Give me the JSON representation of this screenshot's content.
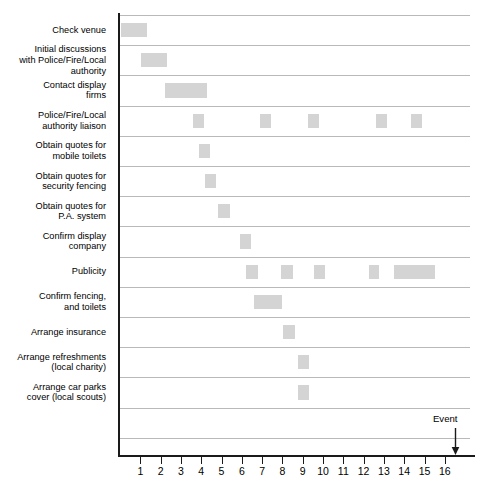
{
  "chart_data": {
    "type": "bar",
    "subtype": "gantt",
    "title": "",
    "xlabel": "",
    "ylabel": "",
    "xlim": [
      0,
      17.5
    ],
    "ylim": [
      0,
      14
    ],
    "grid": true,
    "legend": null,
    "bar_color": "#d4d4d4",
    "axis_color": "#1a1a1a",
    "gridline_color": "#b9b9b9",
    "x_ticks": [
      1,
      2,
      3,
      4,
      5,
      6,
      7,
      8,
      9,
      10,
      11,
      12,
      13,
      14,
      15,
      16
    ],
    "x_tick_labels": [
      "1",
      "2",
      "3",
      "4",
      "5",
      "6",
      "7",
      "8",
      "9",
      "10",
      "11",
      "12",
      "13",
      "14",
      "15",
      "16"
    ],
    "categories": [
      "Check venue",
      "Initial discussions with Police/Fire/Local authority",
      "Contact display firms",
      "Police/Fire/Local authority liaison",
      "Obtain quotes for mobile toilets",
      "Obtain quotes for security fencing",
      "Obtain quotes for P.A. system",
      "Confirm display company",
      "Publicity",
      "Confirm fencing, and toilets",
      "Arrange insurance",
      "Arrange refreshments (local charity)",
      "Arrange car parks cover (local scouts)"
    ],
    "tasks": [
      {
        "name": "Check venue",
        "label_lines": [
          "Check venue"
        ],
        "bars": [
          {
            "start": 0.05,
            "end": 1.35
          }
        ]
      },
      {
        "name": "Initial discussions with Police/Fire/Local authority",
        "label_lines": [
          "Initial discussions",
          "with Police/Fire/Local",
          "authority"
        ],
        "bars": [
          {
            "start": 1.05,
            "end": 2.3
          }
        ]
      },
      {
        "name": "Contact display firms",
        "label_lines": [
          "Contact display",
          "firms"
        ],
        "bars": [
          {
            "start": 2.2,
            "end": 4.3
          }
        ]
      },
      {
        "name": "Police/Fire/Local authority liaison",
        "label_lines": [
          "Police/Fire/Local",
          "authority liaison"
        ],
        "bars": [
          {
            "start": 3.6,
            "end": 4.15
          },
          {
            "start": 6.9,
            "end": 7.45
          },
          {
            "start": 9.25,
            "end": 9.8
          },
          {
            "start": 12.6,
            "end": 13.15
          },
          {
            "start": 14.35,
            "end": 14.9
          }
        ]
      },
      {
        "name": "Obtain quotes for mobile toilets",
        "label_lines": [
          "Obtain quotes for",
          "mobile toilets"
        ],
        "bars": [
          {
            "start": 3.9,
            "end": 4.45
          }
        ]
      },
      {
        "name": "Obtain quotes for security fencing",
        "label_lines": [
          "Obtain quotes for",
          "security fencing"
        ],
        "bars": [
          {
            "start": 4.2,
            "end": 4.75
          }
        ]
      },
      {
        "name": "Obtain quotes for P.A. system",
        "label_lines": [
          "Obtain quotes for",
          "P.A. system"
        ],
        "bars": [
          {
            "start": 4.85,
            "end": 5.4
          }
        ]
      },
      {
        "name": "Confirm display company",
        "label_lines": [
          "Confirm display",
          "company"
        ],
        "bars": [
          {
            "start": 5.9,
            "end": 6.45
          }
        ]
      },
      {
        "name": "Publicity",
        "label_lines": [
          "Publicity"
        ],
        "bars": [
          {
            "start": 6.2,
            "end": 6.8
          },
          {
            "start": 7.95,
            "end": 8.5
          },
          {
            "start": 9.55,
            "end": 10.1
          },
          {
            "start": 12.25,
            "end": 12.75
          },
          {
            "start": 13.5,
            "end": 15.5
          }
        ]
      },
      {
        "name": "Confirm fencing, and toilets",
        "label_lines": [
          "Confirm fencing,",
          "and toilets"
        ],
        "bars": [
          {
            "start": 6.6,
            "end": 8.0
          }
        ]
      },
      {
        "name": "Arrange insurance",
        "label_lines": [
          "Arrange insurance"
        ],
        "bars": [
          {
            "start": 8.05,
            "end": 8.6
          }
        ]
      },
      {
        "name": "Arrange refreshments (local charity)",
        "label_lines": [
          "Arrange refreshments",
          "(local charity)"
        ],
        "bars": [
          {
            "start": 8.75,
            "end": 9.3
          }
        ]
      },
      {
        "name": "Arrange car parks cover (local scouts)",
        "label_lines": [
          "Arrange car parks",
          "cover (local scouts)"
        ],
        "bars": [
          {
            "start": 8.75,
            "end": 9.3
          }
        ]
      }
    ],
    "annotations": [
      {
        "name": "event-marker",
        "text": "Event",
        "x": 16.5,
        "type": "down-arrow"
      }
    ]
  }
}
